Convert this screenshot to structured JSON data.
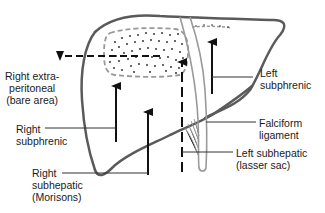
{
  "diagram": {
    "colors": {
      "outline": "#5a5a5a",
      "dashed_area": "#9a9a9a",
      "arrow": "#111111",
      "leader_line": "#333333",
      "text": "#1a1a1a",
      "background": "#ffffff"
    },
    "labels": {
      "right_extraperitoneal": "Right extra-\nperitoneal\n(bare area)",
      "right_subphrenic": "Right\nsubphrenic",
      "right_subhepatic": "Right\nsubhepatic\n(Morisons)",
      "left_subphrenic": "Left\nsubphrenic",
      "falciform_ligament": "Falciform\nligament",
      "left_subhepatic": "Left subhepatic\n(lasser sac)"
    }
  }
}
